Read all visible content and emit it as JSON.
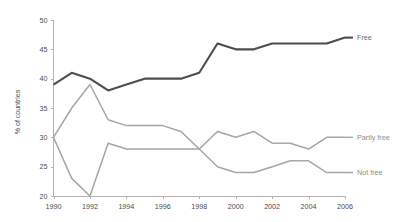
{
  "chart_data": {
    "type": "line",
    "title": "",
    "xlabel": "",
    "ylabel": "% of countries",
    "xlim": [
      1990,
      2006
    ],
    "ylim": [
      20,
      50
    ],
    "yticks": [
      20,
      25,
      30,
      35,
      40,
      45,
      50
    ],
    "xticks": [
      1990,
      1992,
      1994,
      1996,
      1998,
      2000,
      2002,
      2004,
      2006
    ],
    "grid": false,
    "legend_position": "right-inline",
    "x": [
      1990,
      1991,
      1992,
      1993,
      1994,
      1995,
      1996,
      1997,
      1998,
      1999,
      2000,
      2001,
      2002,
      2003,
      2004,
      2005,
      2006
    ],
    "series": [
      {
        "name": "Free",
        "color": "#4d4d4d",
        "values": [
          39,
          41,
          40,
          38,
          39,
          40,
          40,
          40,
          41,
          46,
          45,
          45,
          46,
          46,
          46,
          46,
          47
        ]
      },
      {
        "name": "Partly free",
        "color": "#a6a6a6",
        "values": [
          30,
          35,
          39,
          33,
          32,
          32,
          32,
          31,
          28,
          31,
          30,
          31,
          29,
          29,
          28,
          30,
          30
        ]
      },
      {
        "name": "Not free",
        "color": "#a6a6a6",
        "values": [
          30,
          23,
          20,
          29,
          28,
          28,
          28,
          28,
          28,
          25,
          24,
          24,
          25,
          26,
          26,
          24,
          24
        ]
      }
    ]
  },
  "axis": {
    "ylabel": "% of countries",
    "ytick_labels": [
      "20",
      "25",
      "30",
      "35",
      "40",
      "45",
      "50"
    ],
    "xtick_labels": [
      "1990",
      "1992",
      "1994",
      "1996",
      "1998",
      "2000",
      "2002",
      "2004",
      "2006"
    ]
  },
  "legend": {
    "free": "Free",
    "partly_free": "Partly free",
    "not_free": "Not free"
  },
  "colors": {
    "free_line": "#4d4d4d",
    "grey_line": "#a6a6a6",
    "axis": "#b3b3b3",
    "tick_text": "#4d4d4d",
    "legend_grey": "#8c8c8c",
    "background": "#ffffff"
  }
}
